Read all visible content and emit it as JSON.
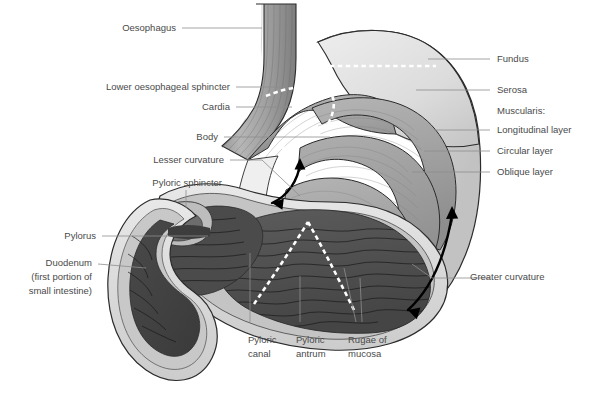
{
  "figure": {
    "type": "anatomical-diagram",
    "background": "#ffffff"
  },
  "palette": {
    "serosa_light": "#dedede",
    "serosa_mid": "#cfcfcf",
    "muscle_mid": "#a6a6a6",
    "muscle_dark": "#8a8a8a",
    "mucosa_dark": "#4f4f4f",
    "lumen_dark": "#3f3f3f",
    "outline": "#2b2b2b",
    "label_text": "#4a4a4a",
    "leader": "#8d8d8d",
    "dashed_marker": "#ffffff",
    "arrow": "#000000"
  },
  "labels_left": [
    {
      "id": "oesophagus",
      "text": "Oesophagus",
      "x": 176,
      "y": 31,
      "anchor": "end"
    },
    {
      "id": "lower-oesophageal-sphincter",
      "text": "Lower oesophageal sphincter",
      "x": 230,
      "y": 90,
      "anchor": "end"
    },
    {
      "id": "cardia",
      "text": "Cardia",
      "x": 230,
      "y": 110,
      "anchor": "end"
    },
    {
      "id": "body",
      "text": "Body",
      "x": 218,
      "y": 140,
      "anchor": "end"
    },
    {
      "id": "lesser-curvature",
      "text": "Lesser curvature",
      "x": 224,
      "y": 163,
      "anchor": "end"
    },
    {
      "id": "pyloric-sphincter",
      "text": "Pyloric sphincter",
      "x": 222,
      "y": 186,
      "anchor": "end"
    },
    {
      "id": "pylorus",
      "text": "Pylorus",
      "x": 96,
      "y": 239,
      "anchor": "end"
    }
  ],
  "labels_duodenum": {
    "id": "duodenum",
    "lines": [
      "Duodenum",
      "(first portion of",
      "small intestine)"
    ],
    "x": 92,
    "y": 266,
    "anchor": "end"
  },
  "labels_right": [
    {
      "id": "fundus",
      "text": "Fundus",
      "x": 497,
      "y": 62,
      "leader": true
    },
    {
      "id": "serosa",
      "text": "Serosa",
      "x": 497,
      "y": 93,
      "leader": true
    },
    {
      "id": "muscularis",
      "text": "Muscularis:",
      "x": 497,
      "y": 114,
      "leader": false
    },
    {
      "id": "longitudinal-layer",
      "text": "Longitudinal layer",
      "x": 497,
      "y": 133,
      "leader": true
    },
    {
      "id": "circular-layer",
      "text": "Circular layer",
      "x": 497,
      "y": 154,
      "leader": true
    },
    {
      "id": "oblique-layer",
      "text": "Oblique layer",
      "x": 497,
      "y": 175,
      "leader": true
    },
    {
      "id": "greater-curvature",
      "text": "Greater curvature",
      "x": 470,
      "y": 280,
      "leader": true
    }
  ],
  "labels_bottom": [
    {
      "id": "pyloric-canal",
      "lines": [
        "Pyloric",
        "canal"
      ],
      "x": 248,
      "y": 343
    },
    {
      "id": "pyloric-antrum",
      "lines": [
        "Pyloric",
        "antrum"
      ],
      "x": 296,
      "y": 343
    },
    {
      "id": "rugae-of-mucosa",
      "lines": [
        "Rugae of",
        "mucosa"
      ],
      "x": 348,
      "y": 343
    }
  ],
  "annotations": {
    "lesser_curvature_arrow": "double-headed-curved-arrow",
    "greater_curvature_arrow": "double-headed-curved-arrow",
    "dashed_boundaries": [
      "cardia-boundary",
      "fundus-boundary",
      "antrum-boundary-left",
      "antrum-boundary-right"
    ]
  }
}
